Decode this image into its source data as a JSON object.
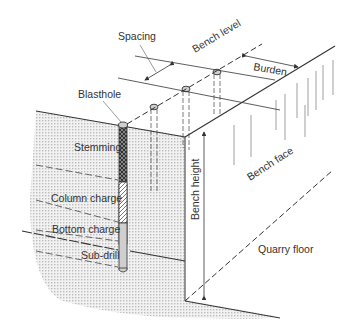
{
  "diagram": {
    "type": "bench blasting cross-section",
    "labels": {
      "spacing": "Spacing",
      "bench_level": "Bench level",
      "burden": "Burden",
      "blasthole": "Blasthole",
      "stemming": "Stemming",
      "column_charge": "Column charge",
      "bottom_charge": "Bottom charge",
      "sub_drill": "Sub-drill",
      "bench_height": "Bench height",
      "bench_face": "Bench face",
      "quarry_floor": "Quarry floor"
    },
    "colors": {
      "line": "#333333",
      "rock_fill": "#d9d9d9",
      "stemming_fill": "#3a3a3a",
      "column_charge_fill": "#ffffff",
      "bottom_charge_fill": "#cfcfcf",
      "background": "#ffffff"
    },
    "blastholes": [
      {
        "name": "front-hole",
        "x": 123,
        "y": 181
      },
      {
        "name": "middle-hole-1",
        "x": 186,
        "y": 89
      },
      {
        "name": "middle-hole-2",
        "x": 217,
        "y": 72
      }
    ]
  }
}
